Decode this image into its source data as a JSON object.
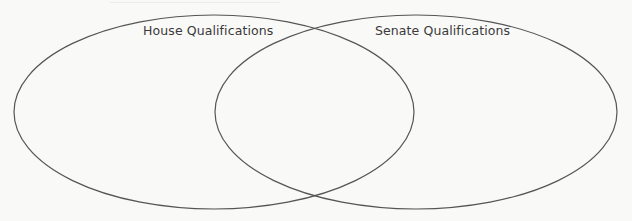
{
  "diagram": {
    "type": "venn",
    "sets": [
      {
        "id": "house",
        "label": "House Qualifications"
      },
      {
        "id": "senate",
        "label": "Senate Qualifications"
      }
    ],
    "regions": {
      "house_only": [],
      "both": [],
      "senate_only": []
    },
    "stroke_color": "#555555",
    "text_color": "#3a3a3a",
    "background_color": "#f9f9f8"
  }
}
